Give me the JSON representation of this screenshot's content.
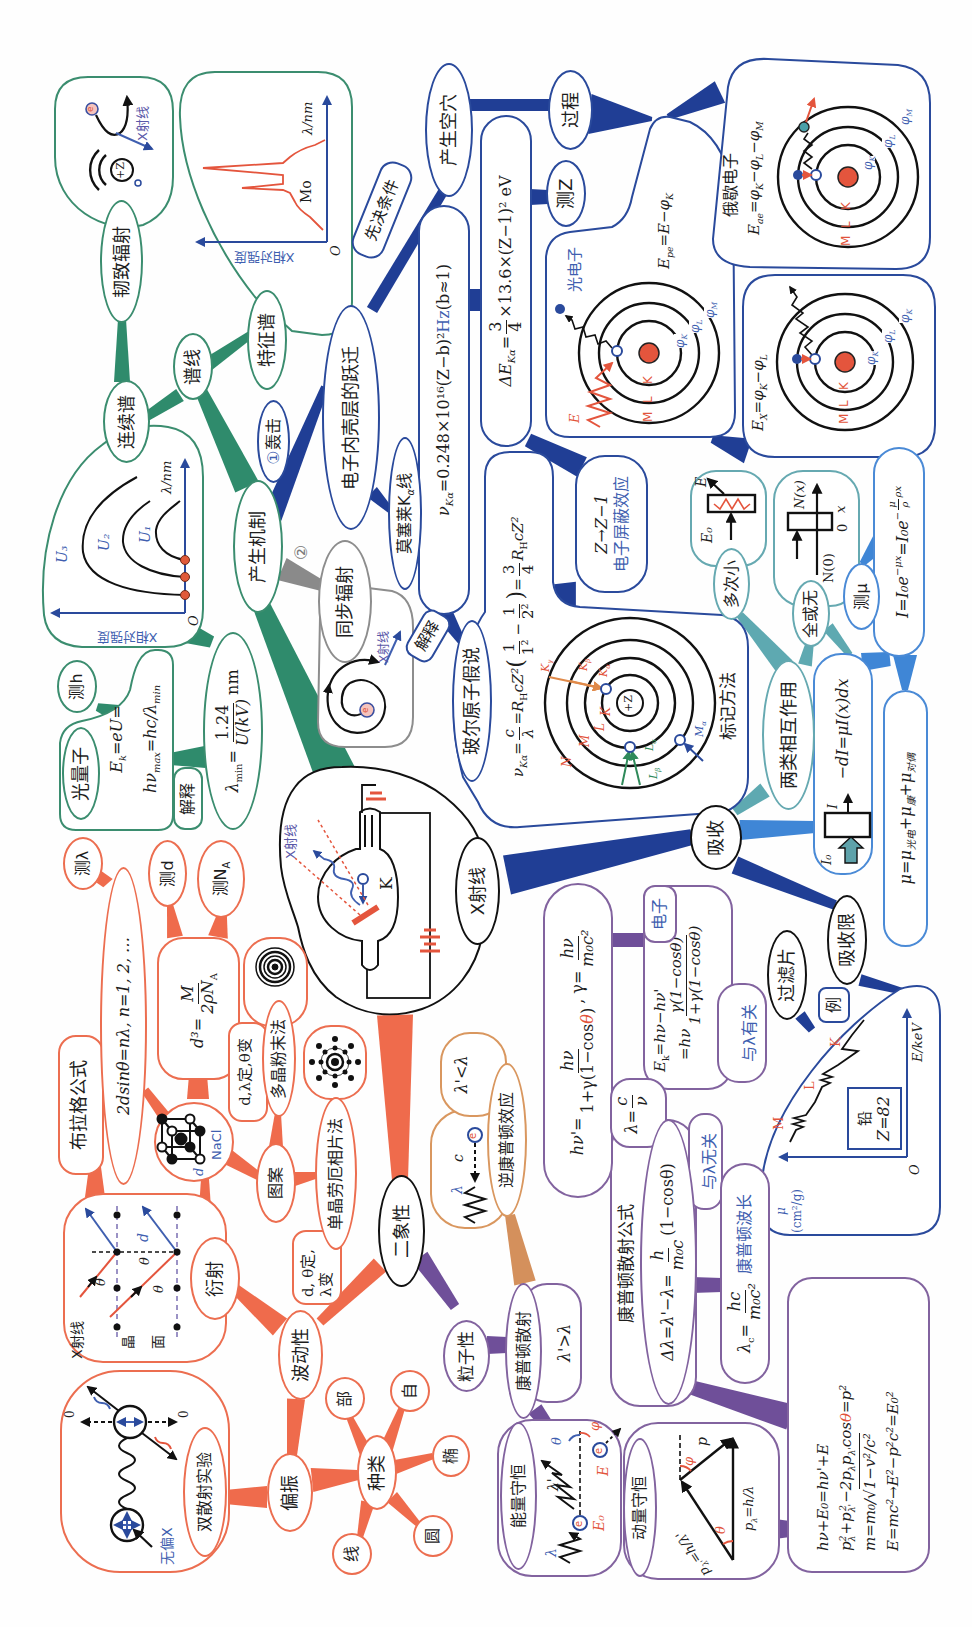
{
  "root": {
    "label": "X射线",
    "tube_ray": "X射线",
    "tube_cathode": "K"
  },
  "production": {
    "label": "产生机制",
    "bombard_num": "①",
    "bombard": "轰击",
    "route2_num": "②",
    "synchrotron": {
      "label": "同步辐射",
      "ray": "X射线",
      "electron": "e"
    },
    "spectrum": "谱线",
    "continuous": {
      "label": "连续谱",
      "ylabel": "X相对强度",
      "xlabel": "λ/nm",
      "origin": "O",
      "curves": [
        "U₁",
        "U₂",
        "U₃"
      ]
    },
    "bremsstrahlung": {
      "label": "韧致辐射",
      "nucleus": "+Z",
      "electron": "e",
      "ray": "X射线"
    },
    "characteristic": {
      "label": "特征谱",
      "ylabel": "X相对强度",
      "xlabel": "λ/nm",
      "element": "Mo",
      "origin": "O"
    },
    "lambda_min": {
      "sym": "λ",
      "sub": "min",
      "eq": "=",
      "num": "1.24",
      "den": "U(kV)",
      "unit": "nm"
    },
    "photon": {
      "label": "光量子",
      "l1": "E",
      "l1_sub": "k",
      "l1_rest": "=eU=",
      "l2": "hν",
      "l2_sub": "max",
      "l2_rest": "=hc/λ",
      "l2_sub2": "min"
    },
    "measure_h": "测h",
    "explain": "解释"
  },
  "inner_shell": {
    "label": "电子内壳层的跃迁",
    "prerequisite": "先决条件",
    "create_hole": "产生空穴",
    "process": "过程",
    "measure_z": "测Z",
    "delta_e": {
      "a": "ΔE",
      "sub": "Kα",
      "eq": "=",
      "num": "3",
      "den": "4",
      "b": "×13.6×(Z−1)² eV"
    },
    "moseley": {
      "a": "莫塞莱K",
      "sub": "α",
      "b": "线"
    },
    "moseley_formula": {
      "a": "ν",
      "sub": "Kα",
      "b": "=0.248×10¹⁶(Z−b)²",
      "unit": "Hz",
      "c": "(b≈1)"
    },
    "explain": "解释",
    "bohr": {
      "label": "玻尔原子假说",
      "formula": {
        "a": "ν",
        "a_sub": "Kα",
        "eq1": "=",
        "f1n": "c",
        "f1d": "λ",
        "b": "=R",
        "b_sub": "H",
        "c": "cZ²",
        "lp": "(",
        "f2n": "1",
        "f2d": "1²",
        "minus": "−",
        "f3n": "1",
        "f3d": "2²",
        "rp": ")",
        "eq2": "=",
        "f4n": "3",
        "f4d": "4",
        "d": "R",
        "d_sub": "H",
        "e": "cZ²"
      },
      "atom": {
        "nucleus": "+Z",
        "shells": [
          "K",
          "L",
          "M",
          "N"
        ],
        "k_lines": [
          {
            "t": "K",
            "s": "γ"
          },
          {
            "t": "K",
            "s": "β"
          },
          {
            "t": "K",
            "s": "α"
          }
        ],
        "l_lines": [
          {
            "t": "L",
            "s": "α"
          },
          {
            "t": "L",
            "s": "β"
          }
        ],
        "m_lines": [
          {
            "t": "M",
            "s": "α"
          }
        ]
      },
      "notation": "标记方法"
    },
    "screening": {
      "line1": "Z→Z−1",
      "line2": "电子屏蔽效应"
    },
    "photoelectron": {
      "label": "光电子",
      "eq": [
        {
          "t": "E",
          "s": "pe"
        },
        {
          "t": "=E−φ",
          "s": "K"
        }
      ],
      "wave": "E",
      "shells": [
        "M",
        "L",
        "K"
      ],
      "levels": [
        {
          "t": "φ",
          "s": "K"
        },
        {
          "t": "φ",
          "s": "L"
        },
        {
          "t": "φ",
          "s": "M"
        }
      ]
    },
    "auger": {
      "label": "俄歇电子",
      "eq": [
        {
          "t": "E",
          "s": "ae"
        },
        {
          "t": "=φ",
          "s": "K"
        },
        {
          "t": "−φ",
          "s": "L"
        },
        {
          "t": "−φ",
          "s": "M"
        }
      ],
      "shells": [
        "M",
        "L",
        "K"
      ],
      "levels": [
        {
          "t": "φ",
          "s": "K"
        },
        {
          "t": "φ",
          "s": "L"
        },
        {
          "t": "φ",
          "s": "M"
        }
      ]
    },
    "fluorescence": {
      "eq": [
        {
          "t": "E",
          "s": "X"
        },
        {
          "t": "=φ",
          "s": "K"
        },
        {
          "t": "−φ",
          "s": "L"
        }
      ],
      "shells": [
        "M",
        "L",
        "K"
      ],
      "levels": [
        {
          "t": "φ",
          "s": "K"
        },
        {
          "t": "φ",
          "s": "L"
        },
        {
          "t": "φ",
          "s": "K"
        }
      ]
    }
  },
  "absorption": {
    "label": "吸收",
    "interactions": "两类相互作用",
    "multiple_small": {
      "label": "多次小",
      "e0": "E₀",
      "e": "E"
    },
    "all_or_none": {
      "label": "全或无",
      "nx": "N(x)",
      "n0": "N(0)",
      "zero": "0",
      "x": "x"
    },
    "measure_mu": "测μ",
    "attenuation": {
      "a": "I=I₀e",
      "sup1": "−μx",
      "b": "=I₀e",
      "sup2a": "−",
      "sup2n": "μ",
      "sup2d": "ρ",
      "sup2b": "ρx"
    },
    "differential": {
      "formula": "−dI=μI(x)dx",
      "i0": "I₀",
      "i": "I"
    },
    "coefficient": [
      {
        "t": "μ=μ",
        "s": "光电"
      },
      {
        "t": "+μ",
        "s": "康"
      },
      {
        "t": "+μ",
        "s": "对偶"
      }
    ],
    "edge": "吸收限",
    "filter": "过滤片",
    "example": "例",
    "lead_chart": {
      "y_sym": "μ",
      "y_unit": "(cm²/g)",
      "xlabel": "E/keV",
      "origin": "O",
      "edges": [
        "M",
        "L",
        "K"
      ],
      "element": "铅",
      "z": "Z=82"
    }
  },
  "wave": {
    "duality": "二象性",
    "label": "波动性",
    "diffraction": {
      "label": "衍射",
      "ray": "X射线",
      "plane": [
        "晶",
        "面"
      ],
      "theta": "θ",
      "d": "d"
    },
    "bragg": {
      "title": "布拉格公式",
      "formula": "2dsinθ=nλ, n=1, 2, …"
    },
    "measure_lambda": "测λ",
    "measure_d": "测d",
    "measure_na": {
      "t": "测N",
      "s": "A"
    },
    "lattice_formula": {
      "lhs": "d³=",
      "num": "M",
      "den": "2ρN",
      "den_sub": "A"
    },
    "crystal": {
      "name": "NaCl",
      "d": "d"
    },
    "pattern": "图案",
    "powder": {
      "label": "多晶粉末法",
      "cond": "d,λ定,θ变"
    },
    "laue": {
      "label": "单晶劳厄相片法",
      "cond1": "d, θ定,",
      "cond2": "λ变"
    },
    "polarization": {
      "label": "偏振",
      "experiment": "双散射实验",
      "unpolarized": "无偏X",
      "zero": "0"
    },
    "kinds": {
      "label": "种类",
      "items": [
        "部",
        "自",
        "椭",
        "圆",
        "线"
      ]
    }
  },
  "particle": {
    "label": "粒子性",
    "compton": {
      "label": "康普顿散射",
      "cond": "λ'>λ"
    },
    "inverse": {
      "label": "逆康普顿效应",
      "cond": "λ'<λ",
      "lambda": "λ",
      "c": "c",
      "e": "e"
    },
    "scattered": {
      "a": "hν'=",
      "n1": "hν",
      "d1a": "1+γ(1−cos",
      "d1t": "θ",
      "d1b": ")",
      "b": ", γ=",
      "n2": "hν",
      "d2": "m₀c²"
    },
    "electron": "电子",
    "kinetic": {
      "l1": "E",
      "l1_sub": "k",
      "l1_rest": "=hν−hν'",
      "l2": "=hν",
      "num": "γ(1−cosθ)",
      "den": "1+γ(1−cosθ)"
    },
    "with_lambda": "与λ有关",
    "lambda_rel": {
      "a": "λ=",
      "num": "c",
      "den": "ν"
    },
    "formula_title": "康普顿散射公式",
    "shift": {
      "a": "Δλ=λ'−λ=",
      "num": "h",
      "den": "m₀c",
      "b": "(1−cosθ)"
    },
    "independent": "与λ无关",
    "compton_wavelength": {
      "t": "λ",
      "s": "c",
      "eq": "=",
      "num": "hc",
      "den": "m₀c²",
      "label": "康普顿波长"
    },
    "energy": {
      "label": "能量守恒",
      "lambda": "λ",
      "lambda_p": "λ'",
      "e0": "E₀",
      "e": "E",
      "theta": "θ",
      "phi": "φ",
      "electron": "e"
    },
    "momentum": {
      "label": "动量守恒",
      "plp": {
        "t": "p",
        "s": "λ'",
        "r": "=h/λ'"
      },
      "pl": {
        "t": "p",
        "s": "λ",
        "r": "=h/λ"
      },
      "theta": "θ",
      "phi": "φ",
      "p": "p"
    },
    "relations": {
      "l1": "hν+E₀=hν'+E",
      "l2": [
        {
          "t": "p",
          "s": "λ",
          "e": "2"
        },
        {
          "t": "+p",
          "s": "λ'",
          "e": "2"
        },
        {
          "t": "−2p",
          "s": "λ"
        },
        {
          "t": "p",
          "s": "λ'"
        },
        {
          "t": "cos"
        }
      ],
      "l2_theta": "θ",
      "l2_end": "=p²",
      "l3_a": "m=m₀/",
      "l3_root": "√",
      "l3_rad": "1−v²/c²",
      "l4": "E=mc²→E²−p²c²=E₀²"
    }
  }
}
